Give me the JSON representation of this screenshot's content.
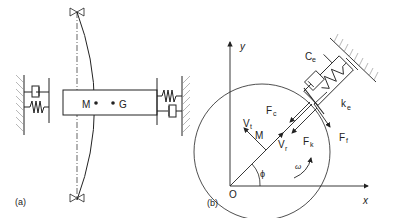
{
  "figure": {
    "panel_a": {
      "label": "(a)",
      "mass_point": "M",
      "center_point": "G"
    },
    "panel_b": {
      "label": "(b)",
      "origin": "O",
      "axis_x": "x",
      "axis_y": "y",
      "point_m": "M",
      "angle": "ϕ",
      "angular_velocity": "ω",
      "damper_label": {
        "main": "C",
        "sub": "e"
      },
      "spring_label": {
        "main": "k",
        "sub": "e"
      },
      "force_c": {
        "main": "F",
        "sub": "c"
      },
      "force_k": {
        "main": "F",
        "sub": "k"
      },
      "force_f": {
        "main": "F",
        "sub": "f"
      },
      "vel_t": {
        "main": "V",
        "sub": "t"
      },
      "vel_r": {
        "main": "V",
        "sub": "r"
      }
    }
  },
  "colors": {
    "line": "#222222",
    "hatch": "#888888",
    "background": "#ffffff"
  }
}
